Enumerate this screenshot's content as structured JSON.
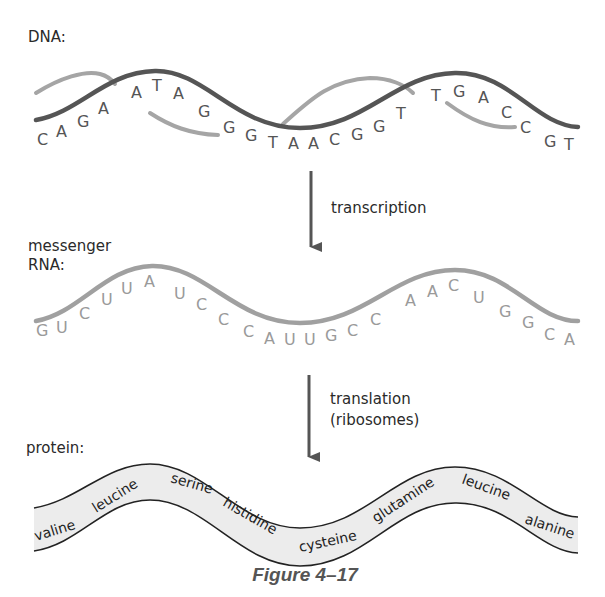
{
  "labels": {
    "dna": "DNA:",
    "mrna_line1": "messenger",
    "mrna_line2": "RNA:",
    "protein": "protein:",
    "transcription": "transcription",
    "translation_line1": "translation",
    "translation_line2": "(ribosomes)"
  },
  "dna": {
    "sequence": [
      "C",
      "A",
      "G",
      "A",
      "A",
      "T",
      "A",
      "G",
      "G",
      "G",
      "T",
      "A",
      "A",
      "C",
      "G",
      "G",
      "T",
      "T",
      "G",
      "A",
      "C",
      "C",
      "G",
      "T"
    ],
    "colors": {
      "strand_dark": "#555555",
      "strand_light": "#a5a5a5"
    }
  },
  "mrna": {
    "sequence": [
      "G",
      "U",
      "C",
      "U",
      "U",
      "A",
      "U",
      "C",
      "C",
      "C",
      "A",
      "U",
      "U",
      "G",
      "C",
      "C",
      "A",
      "A",
      "C",
      "U",
      "G",
      "G",
      "C",
      "A"
    ],
    "color": "#a0a0a0"
  },
  "protein": {
    "amino_acids": [
      "valine",
      "leucine",
      "serine",
      "histidine",
      "cysteine",
      "glutamine",
      "leucine",
      "alanine"
    ],
    "ribbon_fill": "#ececec"
  },
  "caption": "Figure 4–17"
}
